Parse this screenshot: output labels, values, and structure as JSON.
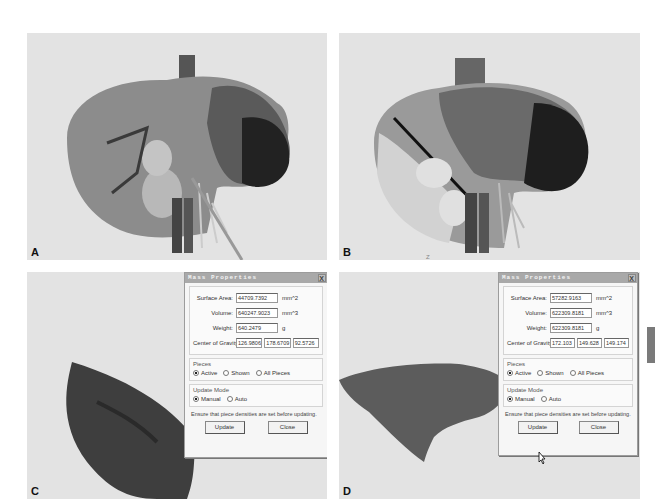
{
  "figure": {
    "panels": [
      {
        "id": "A",
        "label": "A",
        "view": "3D liver reconstruction with vessels and cutting tool"
      },
      {
        "id": "B",
        "label": "B",
        "view": "3D liver reconstruction with resection plane",
        "axis_mark": "Z"
      },
      {
        "id": "C",
        "label": "C",
        "view": "Resected liver piece with mass properties dialog"
      },
      {
        "id": "D",
        "label": "D",
        "view": "Remnant liver piece with mass properties dialog"
      }
    ]
  },
  "dialogs": {
    "C": {
      "title": "Mass Properties",
      "close_label": "X",
      "surface_area_label": "Surface Area:",
      "surface_area": "44709.7392",
      "surface_area_unit": "mm^2",
      "volume_label": "Volume:",
      "volume": "640247.9023",
      "volume_unit": "mm^3",
      "weight_label": "Weight:",
      "weight": "640.2479",
      "weight_unit": "g",
      "cog_label": "Center of Gravity:",
      "cog": [
        "126.9806",
        "178.6709",
        "92.5726"
      ],
      "pieces_legend": "Pieces",
      "pieces_options": [
        "Active",
        "Shown",
        "All Pieces"
      ],
      "pieces_selected": "Active",
      "update_mode_legend": "Update Mode",
      "update_mode_options": [
        "Manual",
        "Auto"
      ],
      "update_mode_selected": "Manual",
      "note": "Ensure that piece densities are set before updating.",
      "update_label": "Update",
      "close_button_label": "Close"
    },
    "D": {
      "title": "Mass Properties",
      "close_label": "X",
      "surface_area_label": "Surface Area:",
      "surface_area": "57282.9163",
      "surface_area_unit": "mm^2",
      "volume_label": "Volume:",
      "volume": "622309.8181",
      "volume_unit": "mm^3",
      "weight_label": "Weight:",
      "weight": "622309.8181",
      "weight_unit": "g",
      "cog_label": "Center of Gravity:",
      "cog": [
        "172.103",
        "149.628",
        "149.174"
      ],
      "pieces_legend": "Pieces",
      "pieces_options": [
        "Active",
        "Shown",
        "All Pieces"
      ],
      "pieces_selected": "Active",
      "update_mode_legend": "Update Mode",
      "update_mode_options": [
        "Manual",
        "Auto"
      ],
      "update_mode_selected": "Manual",
      "note": "Ensure that piece densities are set before updating.",
      "update_label": "Update",
      "close_button_label": "Close"
    }
  },
  "colors": {
    "background": "#e3e3e3",
    "liver": "#8a8a8a",
    "liver_dark": "#2e2e2e",
    "dialog_title": "#a9a9a9"
  }
}
